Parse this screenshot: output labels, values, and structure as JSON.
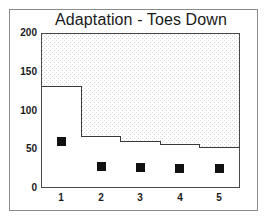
{
  "chart_data": {
    "type": "line",
    "title": "Adaptation - Toes Down",
    "xlabel": "",
    "ylabel": "",
    "xlim": [
      0.5,
      5.5
    ],
    "ylim": [
      0,
      200
    ],
    "yticks": [
      0,
      50,
      100,
      150,
      200
    ],
    "xticks": [
      1,
      2,
      3,
      4,
      5
    ],
    "categories": [
      "1",
      "2",
      "3",
      "4",
      "5"
    ],
    "grid": false,
    "legend": "none",
    "series": [
      {
        "name": "threshold-step",
        "type": "step",
        "style": "post",
        "shaded_above": true,
        "shading": "stipple",
        "values": [
          132,
          66,
          59,
          55,
          52
        ]
      },
      {
        "name": "data-markers",
        "type": "scatter",
        "marker": "filled-square",
        "marker_color": "#111111",
        "values": [
          59,
          27,
          25,
          24,
          24
        ]
      }
    ]
  },
  "axis": {
    "y_tick_labels": [
      "200",
      "150",
      "100",
      "50",
      "0"
    ],
    "x_tick_labels": [
      "1",
      "2",
      "3",
      "4",
      "5"
    ]
  },
  "colors": {
    "frame": "#8a8a8a",
    "axis": "#4a4a4a",
    "marker": "#111111",
    "step_line": "#3a3a3a",
    "shading": "#e9e9e9",
    "background": "#ffffff",
    "text": "#1a1a1a"
  }
}
